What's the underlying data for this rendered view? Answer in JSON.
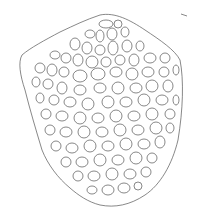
{
  "image": {
    "description": "Edge-detected line drawing of a reticulated cellular structure (net-like pattern of polygonal cells) within a rounded shield-shaped outline",
    "background_color": "#ffffff",
    "line_color": "#555555",
    "width": 199,
    "height": 214
  }
}
